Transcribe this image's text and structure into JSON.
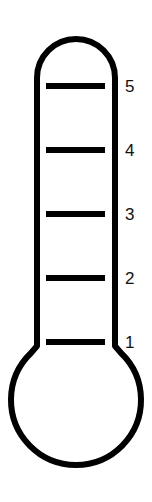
{
  "diagram": {
    "type": "thermometer-scale",
    "stroke_color": "#000000",
    "background": "#ffffff",
    "ticks": [
      {
        "label": "5",
        "y": 86
      },
      {
        "label": "4",
        "y": 150
      },
      {
        "label": "3",
        "y": 214
      },
      {
        "label": "2",
        "y": 278
      },
      {
        "label": "1",
        "y": 342
      }
    ]
  }
}
